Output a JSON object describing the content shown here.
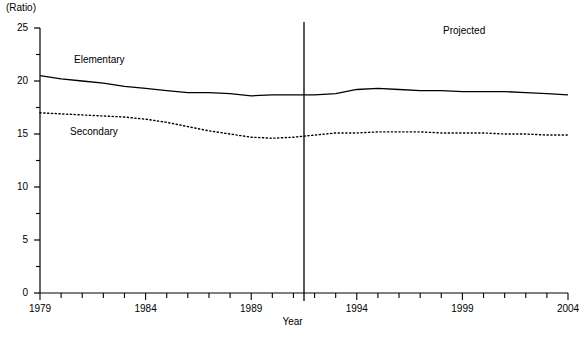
{
  "chart_data": {
    "type": "line",
    "title": "",
    "subtitle": "",
    "unit_label": "(Ratio)",
    "xlabel": "Year",
    "ylabel": "",
    "ylim": [
      0,
      25
    ],
    "xlim": [
      1979,
      2004
    ],
    "grid": false,
    "legend_position": "inline-annotations",
    "y_ticks_major": [
      0,
      5,
      10,
      15,
      20,
      25
    ],
    "y_ticks_minor": [
      2.5,
      7.5,
      12.5,
      17.5,
      22.5
    ],
    "x_ticks": [
      1979,
      1980,
      1981,
      1982,
      1983,
      1984,
      1985,
      1986,
      1987,
      1988,
      1989,
      1990,
      1991,
      1992,
      1993,
      1994,
      1995,
      1996,
      1997,
      1998,
      1999,
      2000,
      2001,
      2002,
      2003,
      2004
    ],
    "x_tick_labels": [
      "1979",
      "",
      "",
      "",
      "",
      "1984",
      "",
      "",
      "",
      "",
      "1989",
      "",
      "",
      "",
      "",
      "1994",
      "",
      "",
      "",
      "",
      "1999",
      "",
      "",
      "",
      "",
      "2004"
    ],
    "x": [
      1979,
      1980,
      1981,
      1982,
      1983,
      1984,
      1985,
      1986,
      1987,
      1988,
      1989,
      1990,
      1991,
      1992,
      1993,
      1994,
      1995,
      1996,
      1997,
      1998,
      1999,
      2000,
      2001,
      2002,
      2003,
      2004
    ],
    "series": [
      {
        "name": "Elementary",
        "style": "solid",
        "color": "#000000",
        "values": [
          20.5,
          20.2,
          20.0,
          19.8,
          19.5,
          19.3,
          19.1,
          18.9,
          18.9,
          18.8,
          18.6,
          18.7,
          18.7,
          18.7,
          18.8,
          19.2,
          19.3,
          19.2,
          19.1,
          19.1,
          19.0,
          19.0,
          19.0,
          18.9,
          18.8,
          18.7
        ]
      },
      {
        "name": "Secondary",
        "style": "dotted",
        "color": "#000000",
        "values": [
          17.0,
          16.9,
          16.8,
          16.7,
          16.6,
          16.4,
          16.1,
          15.7,
          15.3,
          15.0,
          14.7,
          14.6,
          14.7,
          14.9,
          15.1,
          15.1,
          15.2,
          15.2,
          15.2,
          15.1,
          15.1,
          15.1,
          15.0,
          15.0,
          14.9,
          14.9
        ]
      }
    ],
    "annotations": [
      {
        "text": "Projected",
        "x": 2000.5,
        "y": 23.5
      },
      {
        "text": "Elementary",
        "x": 1983.5,
        "y": 21.8
      },
      {
        "text": "Secondary",
        "x": 1983.0,
        "y": 14.3
      }
    ],
    "divider": {
      "x": 1991.5,
      "label": "projection-start-divider"
    }
  }
}
